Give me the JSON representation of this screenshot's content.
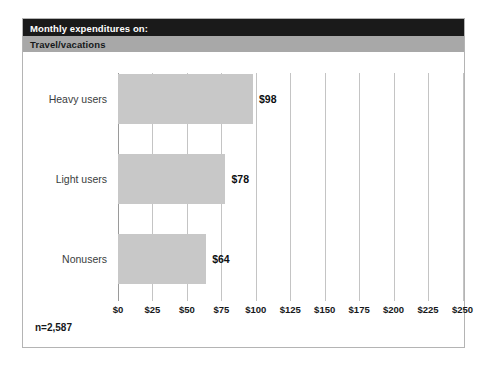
{
  "header": {
    "title": "Monthly expenditures on:",
    "subtitle": "Travel/vacations",
    "title_bg": "#1a1a1a",
    "subtitle_bg": "#a8a8a8"
  },
  "footnote": "n=2,587",
  "chart_data": {
    "type": "bar",
    "orientation": "horizontal",
    "title": "Monthly expenditures on: Travel/vacations",
    "subtitle": "Travel/vacations",
    "categories": [
      "Heavy users",
      "Light users",
      "Nonusers"
    ],
    "values": [
      98,
      78,
      64
    ],
    "value_labels": [
      "$98",
      "$78",
      "$64"
    ],
    "xlabel": "",
    "ylabel": "",
    "xlim": [
      0,
      250
    ],
    "tick_values": [
      0,
      25,
      50,
      75,
      100,
      125,
      150,
      175,
      200,
      225,
      250
    ],
    "tick_labels": [
      "$0",
      "$25",
      "$50",
      "$75",
      "$100",
      "$125",
      "$150",
      "$175",
      "$200",
      "$225",
      "$250"
    ],
    "grid": true,
    "legend": null,
    "bar_color": "#c8c8c8",
    "gridline_color": "#c4c4c4",
    "sample_size_note": "n=2,587"
  }
}
